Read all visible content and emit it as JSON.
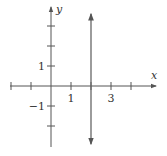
{
  "chart_data": {
    "type": "line",
    "title": "",
    "xlabel": "x",
    "ylabel": "y",
    "xlim": [
      -2,
      5
    ],
    "ylim": [
      -3,
      4
    ],
    "grid": false,
    "x_ticks": [
      -2,
      -1,
      1,
      2,
      3,
      4
    ],
    "y_ticks": [
      -2,
      -1,
      1,
      2,
      3
    ],
    "x_tick_labels": [
      {
        "value": 1,
        "label": "1"
      },
      {
        "value": 3,
        "label": "3"
      }
    ],
    "y_tick_labels": [
      {
        "value": 1,
        "label": "1"
      },
      {
        "value": -1,
        "label": "−1"
      }
    ],
    "series": [
      {
        "name": "vertical line x = 2",
        "equation": "x = 2",
        "x": [
          2,
          2
        ],
        "y": [
          -2.9,
          3.6
        ],
        "arrows": "both"
      }
    ]
  },
  "colors": {
    "axis": "#555555",
    "line": "#666666",
    "text": "#333333"
  }
}
